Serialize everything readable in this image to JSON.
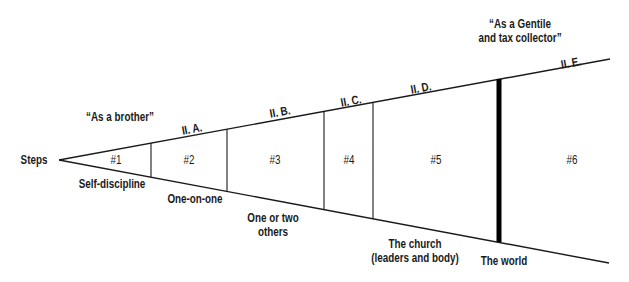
{
  "diagram": {
    "start_label": "Steps",
    "quotes": {
      "brother": "“As a brother”",
      "gentile_line1": "“As a Gentile",
      "gentile_line2": "and tax collector”"
    },
    "sections": [
      {
        "id": "#1",
        "outline": "",
        "bottom_label": [
          "Self-discipline"
        ]
      },
      {
        "id": "#2",
        "outline": "II. A.",
        "bottom_label": [
          "One-on-one"
        ]
      },
      {
        "id": "#3",
        "outline": "II. B.",
        "bottom_label": [
          "One or two",
          "others"
        ]
      },
      {
        "id": "#4",
        "outline": "II. C.",
        "bottom_label": []
      },
      {
        "id": "#5",
        "outline": "II. D.",
        "bottom_label": [
          "The church",
          "(leaders and body)"
        ]
      },
      {
        "id": "#6",
        "outline": "II. E.",
        "bottom_label": [
          "The world"
        ]
      }
    ],
    "colors": {
      "line": "#1a1a1a",
      "background": "#ffffff"
    }
  }
}
